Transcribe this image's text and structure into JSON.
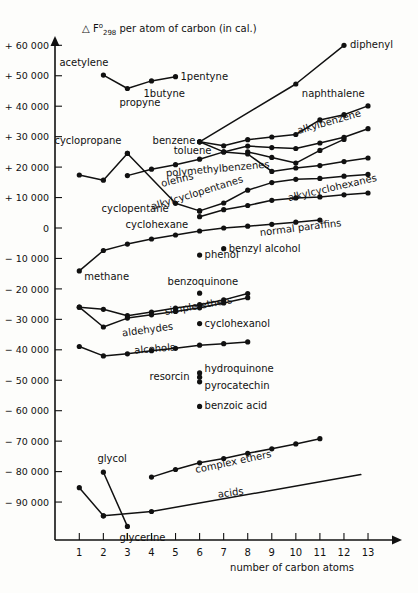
{
  "chart_data": {
    "type": "line",
    "title_parts": {
      "delta": "△",
      "symbol": "F",
      "sup": "o",
      "sub": "298",
      "rest": "per atom of carbon (in cal.)"
    },
    "xlabel": "number of carbon atoms",
    "ylabel": "",
    "xlim": [
      0,
      14
    ],
    "ylim": [
      -95000,
      65000
    ],
    "xticks": [
      1,
      2,
      3,
      4,
      5,
      6,
      7,
      8,
      9,
      10,
      11,
      12,
      13
    ],
    "xtick_labels": [
      "1",
      "2",
      "3",
      "4",
      "5",
      "6",
      "7",
      "8",
      "9",
      "10",
      "11",
      "12",
      "13"
    ],
    "yticks": [
      60000,
      50000,
      40000,
      30000,
      20000,
      10000,
      0,
      -10000,
      -20000,
      -30000,
      -40000,
      -50000,
      -60000,
      -70000,
      -80000,
      -90000
    ],
    "ytick_labels": [
      "+ 60 000",
      "+ 50 000",
      "+ 40 000",
      "+ 30 000",
      "+ 20 000",
      "+ 10 000",
      "0",
      "− 10 000",
      "− 20 000",
      "− 30 000",
      "− 40 000",
      "− 50 000",
      "− 60 000",
      "− 70 000",
      "− 80 000",
      "− 90 000"
    ],
    "grid": false,
    "legend": "inline-annotations",
    "series": [
      {
        "name": "alkynes",
        "label": "",
        "x": [
          2,
          3,
          4,
          5
        ],
        "y": [
          50200,
          45800,
          48300,
          49700
        ],
        "markers": true
      },
      {
        "name": "diphenyl-naphthalene-benzene",
        "label": "",
        "x": [
          6,
          10,
          12
        ],
        "y": [
          28300,
          47300,
          60000
        ],
        "markers": true
      },
      {
        "name": "alkylbenzene",
        "label": "alkylbenzene",
        "x": [
          6,
          7,
          8,
          9,
          10,
          11,
          12,
          13
        ],
        "y": [
          28300,
          27000,
          29000,
          29900,
          30700,
          35500,
          37200,
          40100
        ],
        "markers": true
      },
      {
        "name": "benzene-toluene-branch",
        "label": "",
        "x": [
          6,
          7,
          8,
          9,
          10,
          11,
          12,
          13
        ],
        "y": [
          28300,
          25000,
          26900,
          26400,
          26100,
          27900,
          29800,
          32600
        ],
        "markers": true
      },
      {
        "name": "polymethylbenzenes",
        "label": "polymethylbenzenes",
        "x": [
          8,
          9,
          10,
          11,
          12,
          13
        ],
        "y": [
          25000,
          23200,
          21300,
          25500,
          29100,
          0
        ],
        "markers": true
      },
      {
        "name": "cyclopropane-cyclopentane-cyclohexane",
        "label": "",
        "x": [
          3,
          5,
          6
        ],
        "y": [
          24500,
          8100,
          5600
        ],
        "markers": true
      },
      {
        "name": "cyclopentane-line",
        "label": "",
        "x": [
          1,
          2,
          3
        ],
        "y": [
          17400,
          15700,
          24500
        ],
        "markers": true
      },
      {
        "name": "olefins",
        "label": "olefins",
        "x": [
          3,
          4,
          5,
          6,
          7,
          8,
          9,
          10,
          11,
          12,
          13
        ],
        "y": [
          17200,
          19300,
          20800,
          22600,
          25000,
          24300,
          18600,
          19700,
          20500,
          21800,
          23000
        ],
        "markers": true
      },
      {
        "name": "alkylcyclopentanes",
        "label": "alkylcyclopentanes",
        "x": [
          6,
          7,
          8,
          9,
          10,
          11,
          12,
          13
        ],
        "y": [
          5600,
          8200,
          12400,
          14900,
          16000,
          16300,
          17000,
          17600
        ],
        "markers": true
      },
      {
        "name": "alkylcyclohexanes",
        "label": "alkylcyclohexanes",
        "x": [
          6,
          7,
          8,
          9,
          10,
          11,
          12,
          13
        ],
        "y": [
          3700,
          6000,
          7400,
          9100,
          9900,
          10200,
          10900,
          11500
        ],
        "markers": true
      },
      {
        "name": "normal paraffins",
        "label": "normal paraffins",
        "x": [
          1,
          2,
          3,
          4,
          5,
          6,
          7,
          8,
          9,
          10,
          11
        ],
        "y": [
          -14100,
          -7400,
          -5300,
          -3600,
          -2300,
          -1000,
          0,
          600,
          1200,
          1900,
          2600
        ],
        "markers": true
      },
      {
        "name": "simple ethers",
        "label": "simple ethers",
        "x": [
          1,
          2,
          3,
          4,
          5,
          6,
          7,
          8
        ],
        "y": [
          -26000,
          -26700,
          -28800,
          -27600,
          -26300,
          -25200,
          -23600,
          -21500
        ],
        "markers": true
      },
      {
        "name": "aldehydes",
        "label": "aldehydes",
        "x": [
          1,
          2,
          3,
          4,
          5,
          6,
          7,
          8
        ],
        "y": [
          -26000,
          -32500,
          -29600,
          -28500,
          -27400,
          -26200,
          -24600,
          -22900
        ],
        "markers": true
      },
      {
        "name": "alcohols",
        "label": "alcohols",
        "x": [
          1,
          2,
          3,
          4,
          5,
          6,
          7,
          8
        ],
        "y": [
          -38900,
          -42000,
          -41300,
          -40300,
          -39500,
          -38500,
          -38000,
          -37400
        ],
        "markers": true
      },
      {
        "name": "complex ethers",
        "label": "complex ethers",
        "x": [
          4,
          5,
          6,
          7,
          8,
          9,
          10,
          11
        ],
        "y": [
          -81800,
          -79300,
          -77100,
          -75700,
          -74000,
          -72500,
          -70900,
          -69200
        ],
        "markers": true
      },
      {
        "name": "acids",
        "label": "acids",
        "x": [
          2,
          4,
          12.7
        ],
        "y": [
          -94500,
          -93100,
          -81000
        ],
        "markers": true
      },
      {
        "name": "glycol-glycerine",
        "label": "",
        "x": [
          2,
          3
        ],
        "y": [
          -80200,
          -98000
        ],
        "markers": true
      },
      {
        "name": "methanol-glycol-branch",
        "label": "",
        "x": [
          1,
          2
        ],
        "y": [
          -85300,
          -94500
        ],
        "markers": true
      }
    ],
    "points": [
      {
        "label": "acetylene",
        "x": 2,
        "y": 50200,
        "label_dx": -44,
        "label_dy": -9,
        "marker": false
      },
      {
        "label": "propyne",
        "x": 3,
        "y": 45800,
        "label_dx": -8,
        "label_dy": 17,
        "marker": false
      },
      {
        "label": "1butyne",
        "x": 4,
        "y": 48300,
        "label_dx": -8,
        "label_dy": 16,
        "marker": false
      },
      {
        "label": "1pentyne",
        "x": 5,
        "y": 49700,
        "label_dx": 5,
        "label_dy": 3,
        "marker": false
      },
      {
        "label": "diphenyl",
        "x": 12,
        "y": 60000,
        "label_dx": 6,
        "label_dy": 3,
        "marker": false
      },
      {
        "label": "naphthalene",
        "x": 10,
        "y": 47300,
        "label_dx": 6,
        "label_dy": 13,
        "marker": false
      },
      {
        "label": "benzene",
        "x": 6,
        "y": 28300,
        "label_dx": -47,
        "label_dy": 2,
        "marker": false
      },
      {
        "label": "toluene",
        "x": 7,
        "y": 25000,
        "label_dx": -50,
        "label_dy": 2,
        "marker": false
      },
      {
        "label": "cyclopropane",
        "x": 3,
        "y": 24500,
        "label_dx": -73,
        "label_dy": -9,
        "marker": false
      },
      {
        "label": "cyclopentane",
        "x": 5,
        "y": 8100,
        "label_dx": -74,
        "label_dy": 9,
        "marker": false
      },
      {
        "label": "cyclohexane",
        "x": 6,
        "y": 5600,
        "label_dx": -74,
        "label_dy": 17,
        "marker": false
      },
      {
        "label": "methane",
        "x": 1,
        "y": -14100,
        "label_dx": 5,
        "label_dy": 9,
        "marker": false
      },
      {
        "label": "phenol",
        "x": 6,
        "y": -8900,
        "label_dx": 5,
        "label_dy": 3,
        "marker": true
      },
      {
        "label": "benzyl alcohol",
        "x": 7,
        "y": -6800,
        "label_dx": 5,
        "label_dy": 3,
        "marker": true
      },
      {
        "label": "benzoquinone",
        "x": 6,
        "y": -21400,
        "label_dx": -32,
        "label_dy": -8,
        "marker": true
      },
      {
        "label": "cyclohexanol",
        "x": 6,
        "y": -31400,
        "label_dx": 5,
        "label_dy": 3,
        "marker": true
      },
      {
        "label": "resorcin",
        "x": 6,
        "y": -49000,
        "label_dx": -50,
        "label_dy": 3,
        "marker": true
      },
      {
        "label": "hydroquinone",
        "x": 6,
        "y": -47600,
        "label_dx": 5,
        "label_dy": -1,
        "marker": true
      },
      {
        "label": "pyrocatechin",
        "x": 6,
        "y": -50500,
        "label_dx": 5,
        "label_dy": 7,
        "marker": true
      },
      {
        "label": "benzoic acid",
        "x": 6,
        "y": -58600,
        "label_dx": 5,
        "label_dy": 3,
        "marker": true
      },
      {
        "label": "glycol",
        "x": 2,
        "y": -80200,
        "label_dx": -6,
        "label_dy": -10,
        "marker": false
      },
      {
        "label": "glycerine",
        "x": 3,
        "y": -98000,
        "label_dx": -8,
        "label_dy": 15,
        "marker": false
      }
    ],
    "series_labels": [
      {
        "text": "alkylbenzene",
        "x": 330,
        "y": 125,
        "rotate": -16
      },
      {
        "text": "polymethylbenzenes",
        "x": 218,
        "y": 172,
        "rotate": -5
      },
      {
        "text": "olefins",
        "x": 178,
        "y": 183,
        "rotate": -14
      },
      {
        "text": "alkylcyclopentanes",
        "x": 198,
        "y": 196,
        "rotate": -17
      },
      {
        "text": "alkylcyclohexanes",
        "x": 333,
        "y": 191,
        "rotate": -13
      },
      {
        "text": "normal paraffins",
        "x": 301,
        "y": 231,
        "rotate": -7
      },
      {
        "text": "simple ethers",
        "x": 199,
        "y": 309,
        "rotate": -10
      },
      {
        "text": "aldehydes",
        "x": 148,
        "y": 333,
        "rotate": -8
      },
      {
        "text": "alcohols",
        "x": 155,
        "y": 352,
        "rotate": -5
      },
      {
        "text": "complex ethers",
        "x": 234,
        "y": 465,
        "rotate": -12
      },
      {
        "text": "acids",
        "x": 231,
        "y": 496,
        "rotate": -8
      }
    ]
  },
  "axes": {
    "x_axis_title": "number of carbon atoms",
    "y_axis_arrow": true,
    "x_axis_arrow": true
  },
  "colors": {
    "ink": "#111111",
    "background": "#fdfdfb"
  }
}
